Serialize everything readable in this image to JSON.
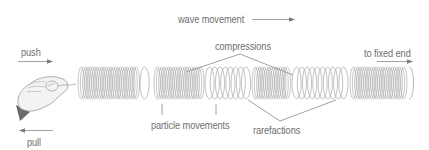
{
  "diagram": {
    "labels": {
      "wave_movement": "wave movement",
      "push": "push",
      "pull": "pull",
      "compressions": "compressions",
      "to_fixed_end": "to fixed end",
      "particle_movements": "particle movements",
      "rarefactions": "rarefactions"
    },
    "spring": {
      "x_start": 78,
      "x_end": 413,
      "center_y": 83,
      "radius_y": 16,
      "regions": [
        {
          "type": "compression",
          "from": 78,
          "to": 140
        },
        {
          "type": "rarefaction",
          "from": 140,
          "to": 154
        },
        {
          "type": "compression",
          "from": 154,
          "to": 205
        },
        {
          "type": "rarefaction",
          "from": 205,
          "to": 252
        },
        {
          "type": "compression",
          "from": 252,
          "to": 292
        },
        {
          "type": "rarefaction",
          "from": 292,
          "to": 350
        },
        {
          "type": "compression",
          "from": 350,
          "to": 408
        }
      ]
    },
    "colors": {
      "line": "#8a8a8a",
      "coil": "#9a9a9a",
      "text": "#6e6e6e",
      "hand_fill": "#f2f2f2",
      "hand_stroke": "#9a9a9a",
      "sleeve": "#6a6a6a"
    },
    "icons": {
      "hand": "hand-holding-spring-icon",
      "push_arrow": "arrow-right-icon",
      "pull_arrow": "arrow-left-icon",
      "wave_arrow": "arrow-right-icon",
      "fixed_end_arrow": "arrow-right-icon"
    }
  }
}
